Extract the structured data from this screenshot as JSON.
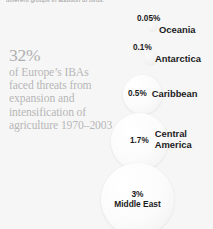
{
  "top_caption": "different groups in addition to birds.",
  "statement": {
    "headline": "32%",
    "body": "of Europe’s IBAs faced threats from expansion and intensification of agriculture 1970–2003"
  },
  "chart_data": {
    "type": "bubble",
    "title": "",
    "xlabel": "",
    "ylabel": "",
    "unit": "%",
    "categories": [
      "Oceania",
      "Antarctica",
      "Caribbean",
      "Central America",
      "Middle East"
    ],
    "values": [
      0.05,
      0.1,
      0.5,
      1.7,
      3
    ],
    "labels": [
      "0.05%",
      "0.1%",
      "0.5%",
      "1.7%",
      "3%"
    ],
    "legend": "none",
    "grid": false,
    "bubbles": [
      {
        "name": "Oceania",
        "value": 0.05,
        "value_label": "0.05%",
        "label": "Oceania",
        "label_line1": "Oceania",
        "label_line2": "",
        "label_inside": false,
        "value_inside": false
      },
      {
        "name": "Antarctica",
        "value": 0.1,
        "value_label": "0.1%",
        "label": "Antarctica",
        "label_line1": "Antarctica",
        "label_line2": "",
        "label_inside": false,
        "value_inside": false
      },
      {
        "name": "Caribbean",
        "value": 0.5,
        "value_label": "0.5%",
        "label": "Caribbean",
        "label_line1": "Caribbean",
        "label_line2": "",
        "label_inside": false,
        "value_inside": false
      },
      {
        "name": "Central America",
        "value": 1.7,
        "value_label": "1.7%",
        "label": "Central America",
        "label_line1": "Central",
        "label_line2": "America",
        "label_inside": false,
        "value_inside": false
      },
      {
        "name": "Middle East",
        "value": 3,
        "value_label": "3%",
        "label": "Middle East",
        "label_line1": "Middle East",
        "label_line2": "",
        "label_inside": true,
        "value_inside": true
      }
    ]
  },
  "colors": {
    "background": "#f6f6f6",
    "bubble_fill": "#fbfbfb",
    "bubble_edge": "#efefef",
    "text_dark": "#1b1b1b",
    "text_muted": "#b4b4b4",
    "caption_grey": "#9a9a9a"
  }
}
